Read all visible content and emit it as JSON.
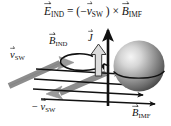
{
  "figure": {
    "title_equation": {
      "lhs_symbol": "E",
      "lhs_sub": "IND",
      "equals": " = (",
      "minus": "−",
      "v_symbol": "v",
      "v_sub": "SW",
      "close_cross": " ) × ",
      "b_symbol": "B",
      "b_sub": "IMF"
    },
    "labels": {
      "vsw": {
        "symbol": "v",
        "sub": "SW",
        "prefix": ""
      },
      "neg_vsw": {
        "symbol": "v",
        "sub": "SW",
        "prefix": "− "
      },
      "bind": {
        "symbol": "B",
        "sub": "IND",
        "prefix": ""
      },
      "current": {
        "symbol": "J",
        "sub": "",
        "prefix": ""
      },
      "bimf": {
        "symbol": "B",
        "sub": "IMF",
        "prefix": ""
      }
    },
    "colors": {
      "background": "#ffffff",
      "stroke_black": "#111111",
      "solar_wind_gray": "#8f8f8f",
      "solar_wind_gray_dark": "#6d6d6d",
      "current_arrow_fill": "#d9d9d9",
      "sphere_light": "#f2f2f2",
      "sphere_mid": "#9a9a9a",
      "sphere_dark": "#3a3a3a"
    },
    "elements": {
      "sphere_name": "magnetosphere-body",
      "vertical_arrow_name": "e-ind-arrow",
      "loop_name": "b-ind-field-loop",
      "field_lines_count": 4
    }
  }
}
